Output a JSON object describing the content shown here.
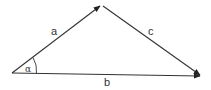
{
  "diagram": {
    "stroke_color": "#333333",
    "background": "#ffffff",
    "vertices": {
      "origin": {
        "x": 12,
        "y": 73
      },
      "apex": {
        "x": 101,
        "y": 5
      },
      "right": {
        "x": 201,
        "y": 76
      }
    },
    "vectors": [
      {
        "name": "a",
        "from": "origin",
        "to": "apex",
        "label": "a"
      },
      {
        "name": "c",
        "from": "apex",
        "to": "right",
        "label": "c"
      },
      {
        "name": "b",
        "from": "origin",
        "to": "right",
        "label": "b"
      }
    ],
    "angle": {
      "label": "α",
      "at": "origin"
    },
    "labels": {
      "a": "a",
      "b": "b",
      "c": "c",
      "alpha": "α"
    }
  }
}
